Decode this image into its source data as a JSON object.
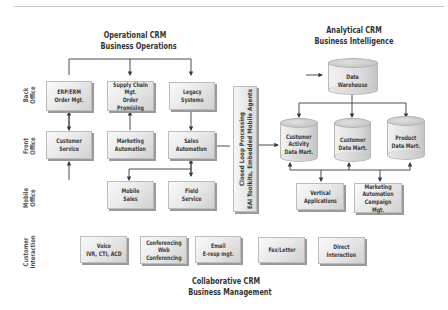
{
  "diagram": {
    "sections": {
      "operational": {
        "line1": "Operational CRM",
        "line2": "Business Operations"
      },
      "analytical": {
        "line1": "Analytical CRM",
        "line2": "Business Intelligence"
      },
      "collaborative": {
        "line1": "Collaborative CRM",
        "line2": "Business Management"
      }
    },
    "row_labels": {
      "back_office": "Back\nOffice",
      "front_office": "Front\nOffice",
      "mobile_office": "Mobile\nOffice",
      "customer_interaction": "Customer\nInteraction"
    },
    "operational_boxes": {
      "erp": "ERP/ERM\nOrder Mgt.",
      "supply_chain": "Supply Chain\nMgt.\nOrder Promising",
      "legacy": "Legacy\nSystems",
      "customer_service": "Customer\nService",
      "marketing_automation": "Marketing\nAutomation",
      "sales_automation": "Sales\nAutomation",
      "mobile_sales": "Mobile\nSales",
      "field_service": "Field\nService"
    },
    "closed_loop": "Closed Loop Processing\nEAI Toolkits, Embedded Mobile Agents",
    "analytical_items": {
      "data_warehouse": "Data\nWarehouse",
      "customer_activity_mart": "Customer\nActivity\nData Mart.",
      "customer_mart": "Customer\nData Mart.",
      "product_mart": "Product\nData Mart.",
      "vertical_apps": "Vertical\nApplications",
      "campaign_mgt": "Marketing\nAutomation\nCampaign Mgt."
    },
    "collaborative_boxes": {
      "voice": "Voice\nIVR, CTI, ACD",
      "conferencing": "Conferencing\nWeb\nConferencing",
      "email": "Email\nE-resp mgt.",
      "fax": "Fax/Letter",
      "direct": "Direct\nInteraction"
    },
    "colors": {
      "line": "#3a3a3a",
      "box_fill": "#e6e6e6",
      "box_shadow": "#9a9a9a",
      "text": "#333333"
    }
  }
}
